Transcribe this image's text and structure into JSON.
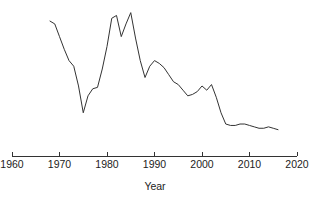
{
  "chart_data": {
    "type": "line",
    "title": "",
    "subtitle": "",
    "xlabel": "Year",
    "ylabel": "",
    "grid": false,
    "legend": "none",
    "xlim": [
      1960,
      2020
    ],
    "ylim": [
      0,
      100
    ],
    "xticks": [
      1960,
      1970,
      1980,
      1990,
      2000,
      2010,
      2020
    ],
    "xticklabels": [
      "1960",
      "1970",
      "1980",
      "1990",
      "2000",
      "2010",
      "2020"
    ],
    "yticks": [],
    "yticklabels": [],
    "series": [
      {
        "name": "series-1",
        "color": "#333333",
        "x": [
          1968,
          1969,
          1970,
          1971,
          1972,
          1973,
          1974,
          1975,
          1976,
          1977,
          1978,
          1979,
          1980,
          1981,
          1982,
          1983,
          1984,
          1985,
          1986,
          1987,
          1988,
          1989,
          1990,
          1991,
          1992,
          1993,
          1994,
          1995,
          1996,
          1997,
          1998,
          1999,
          2000,
          2001,
          2002,
          2003,
          2004,
          2005,
          2006,
          2007,
          2008,
          2009,
          2010,
          2011,
          2012,
          2013,
          2014,
          2015,
          2016
        ],
        "values": [
          90,
          88,
          79,
          70,
          62,
          58,
          44,
          25,
          37,
          42,
          43,
          56,
          72,
          92,
          94,
          79,
          88,
          96,
          78,
          62,
          50,
          58,
          62,
          60,
          57,
          52,
          47,
          45,
          41,
          37,
          38,
          40,
          44,
          41,
          45,
          36,
          25,
          17,
          16,
          16,
          17,
          17,
          16,
          15,
          14,
          14,
          15,
          14,
          13
        ]
      }
    ]
  },
  "axis": {
    "x_title": "Year"
  }
}
